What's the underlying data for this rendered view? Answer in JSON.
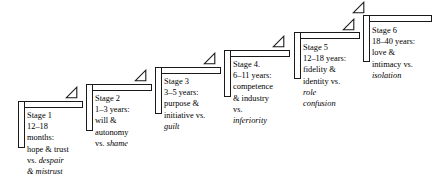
{
  "diagram": {
    "ink_color": "#1a1a1a",
    "background_color": "#ffffff",
    "arrow_icon_name": "step-up-triangle-arrow-icon",
    "stages": [
      {
        "id": "stage-1",
        "lines": [
          {
            "text": "Stage 1",
            "italic": false
          },
          {
            "text": "12–18",
            "italic": false
          },
          {
            "text": "months:",
            "italic": false
          },
          {
            "text": "hope & trust",
            "italic": false
          },
          {
            "text": "vs. ",
            "italic": false,
            "tail": "despair",
            "tail_italic": true
          },
          {
            "text": "& mistrust",
            "italic": true
          }
        ]
      },
      {
        "id": "stage-2",
        "lines": [
          {
            "text": "Stage 2",
            "italic": false
          },
          {
            "text": "1–3 years:",
            "italic": false
          },
          {
            "text": "will &",
            "italic": false
          },
          {
            "text": "autonomy",
            "italic": false
          },
          {
            "text": "vs. ",
            "italic": false,
            "tail": "shame",
            "tail_italic": true
          }
        ]
      },
      {
        "id": "stage-3",
        "lines": [
          {
            "text": "Stage 3",
            "italic": false
          },
          {
            "text": "3–5 years:",
            "italic": false
          },
          {
            "text": "purpose &",
            "italic": false
          },
          {
            "text": "initiative vs.",
            "italic": false
          },
          {
            "text": "guilt",
            "italic": true
          }
        ]
      },
      {
        "id": "stage-4",
        "lines": [
          {
            "text": "Stage 4.",
            "italic": false
          },
          {
            "text": "6–11 years:",
            "italic": false
          },
          {
            "text": "competence",
            "italic": false
          },
          {
            "text": "& industry",
            "italic": false
          },
          {
            "text": "vs.",
            "italic": false
          },
          {
            "text": "inferiority",
            "italic": true
          }
        ]
      },
      {
        "id": "stage-5",
        "lines": [
          {
            "text": "Stage 5",
            "italic": false
          },
          {
            "text": "12–18 years:",
            "italic": false
          },
          {
            "text": "fidelity &",
            "italic": false
          },
          {
            "text": "identity vs.",
            "italic": false
          },
          {
            "text": "role",
            "italic": true
          },
          {
            "text": "confusion",
            "italic": true
          }
        ]
      },
      {
        "id": "stage-6",
        "lines": [
          {
            "text": "Stage 6",
            "italic": false
          },
          {
            "text": "18–40 years:",
            "italic": false
          },
          {
            "text": "love &",
            "italic": false
          },
          {
            "text": "intimacy vs.",
            "italic": false
          },
          {
            "text": "isolation",
            "italic": true
          }
        ]
      }
    ]
  },
  "geometry": {
    "steps": [
      {
        "x": 18,
        "y": 101,
        "bar_width": 65,
        "bar_height": 47,
        "arrow_x": 65,
        "arrow_y": 86,
        "label_x": 27,
        "label_y": 110
      },
      {
        "x": 86,
        "y": 84,
        "bar_width": 66,
        "bar_height": 47,
        "arrow_x": 134,
        "arrow_y": 69,
        "label_x": 95,
        "label_y": 93
      },
      {
        "x": 155,
        "y": 67,
        "bar_width": 66,
        "bar_height": 47,
        "arrow_x": 203,
        "arrow_y": 52,
        "label_x": 164,
        "label_y": 76
      },
      {
        "x": 224,
        "y": 50,
        "bar_width": 66,
        "bar_height": 47,
        "arrow_x": 272,
        "arrow_y": 35,
        "label_x": 233,
        "label_y": 59
      },
      {
        "x": 294,
        "y": 32,
        "bar_width": 66,
        "bar_height": 47,
        "arrow_x": 342,
        "arrow_y": 18,
        "label_x": 303,
        "label_y": 42
      },
      {
        "x": 363,
        "y": 15,
        "bar_width": 69,
        "bar_height": 47,
        "arrow_x": 352,
        "arrow_y": 1,
        "label_x": 372,
        "label_y": 25
      }
    ]
  }
}
